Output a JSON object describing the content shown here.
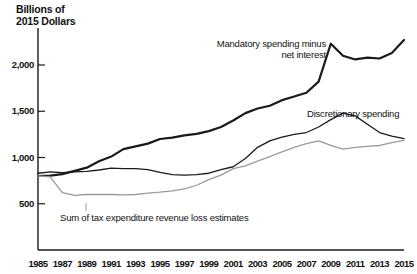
{
  "chart_data": {
    "type": "line",
    "title": "Billions of\n2015 Dollars",
    "xlabel": "",
    "ylabel": "Billions of 2015 Dollars",
    "xlim": [
      1985,
      2015
    ],
    "ylim": [
      0,
      2400
    ],
    "yticks": [
      "500",
      "1,000",
      "1,500",
      "2,000"
    ],
    "ytick_values": [
      500,
      1000,
      1500,
      2000
    ],
    "xticks": [
      "1985",
      "1987",
      "1989",
      "1991",
      "1993",
      "1995",
      "1997",
      "1999",
      "2001",
      "2003",
      "2005",
      "2007",
      "2009",
      "2011",
      "2013",
      "2015"
    ],
    "xtick_values": [
      1985,
      1987,
      1989,
      1991,
      1993,
      1995,
      1997,
      1999,
      2001,
      2003,
      2005,
      2007,
      2009,
      2011,
      2013,
      2015
    ],
    "grid": false,
    "legend_position": "inline-annotations",
    "x": [
      1985,
      1986,
      1987,
      1988,
      1989,
      1990,
      1991,
      1992,
      1993,
      1994,
      1995,
      1996,
      1997,
      1998,
      1999,
      2000,
      2001,
      2002,
      2003,
      2004,
      2005,
      2006,
      2007,
      2008,
      2009,
      2010,
      2011,
      2012,
      2013,
      2014,
      2015
    ],
    "series": [
      {
        "name": "Mandatory spending minus net interest",
        "color": "#1a1a1a",
        "width": 2.2,
        "values": [
          800,
          805,
          820,
          855,
          890,
          960,
          1010,
          1090,
          1120,
          1150,
          1200,
          1215,
          1240,
          1255,
          1285,
          1330,
          1400,
          1480,
          1530,
          1560,
          1620,
          1660,
          1700,
          1820,
          2230,
          2100,
          2060,
          2080,
          2070,
          2130,
          2270
        ]
      },
      {
        "name": "Discretionary spending",
        "color": "#1a1a1a",
        "width": 1.3,
        "values": [
          830,
          845,
          835,
          845,
          850,
          865,
          885,
          880,
          880,
          870,
          840,
          815,
          810,
          815,
          830,
          870,
          900,
          990,
          1110,
          1180,
          1220,
          1250,
          1270,
          1330,
          1410,
          1480,
          1450,
          1360,
          1270,
          1230,
          1205
        ]
      },
      {
        "name": "Sum of tax expenditure revenue loss estimates",
        "color": "#9a9a9a",
        "width": 1.3,
        "values": [
          800,
          790,
          620,
          590,
          600,
          600,
          600,
          595,
          600,
          615,
          625,
          640,
          660,
          700,
          760,
          810,
          880,
          910,
          960,
          1010,
          1060,
          1110,
          1150,
          1180,
          1130,
          1090,
          1110,
          1120,
          1130,
          1160,
          1185
        ]
      }
    ],
    "annotations": [
      {
        "text": "Mandatory spending minus\nnet interest",
        "anchor": "mandatory"
      },
      {
        "text": "Discretionary spending",
        "anchor": "discretionary"
      },
      {
        "text": "Sum of tax expenditure revenue loss estimates",
        "anchor": "tax-expenditure"
      }
    ]
  }
}
